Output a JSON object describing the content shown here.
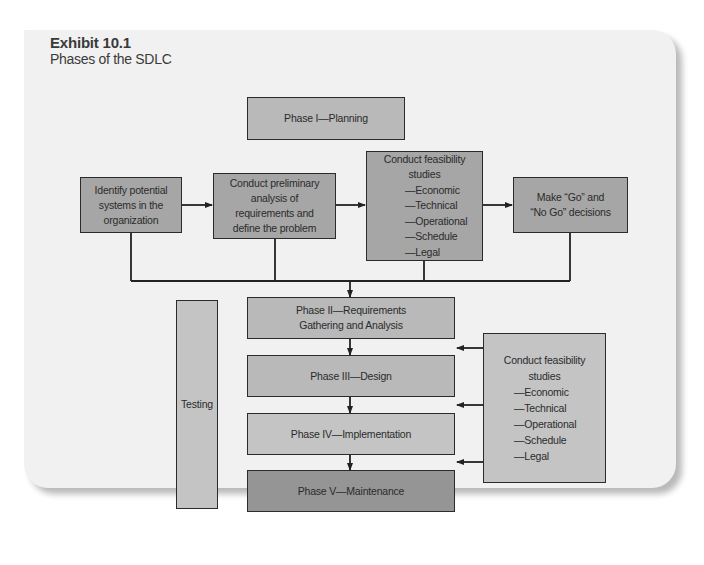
{
  "exhibit": {
    "title": "Exhibit 10.1",
    "subtitle": "Phases of the SDLC"
  },
  "diagram": {
    "phase1": "Phase I—Planning",
    "planning_steps": [
      {
        "id": "identify",
        "lines": [
          "Identify potential",
          "systems in the",
          "organization"
        ]
      },
      {
        "id": "preliminary",
        "lines": [
          "Conduct preliminary",
          "analysis of",
          "requirements and",
          "define the problem"
        ]
      },
      {
        "id": "feasibility",
        "lines": [
          "Conduct feasibility",
          "studies"
        ],
        "items": [
          "—Economic",
          "—Technical",
          "—Operational",
          "—Schedule",
          "—Legal"
        ]
      },
      {
        "id": "go-nogo",
        "lines": [
          "Make “Go” and",
          "“No Go” decisions"
        ]
      }
    ],
    "phases": [
      {
        "lines": [
          "Phase II—Requirements",
          "Gathering and Analysis"
        ]
      },
      {
        "lines": [
          "Phase III—Design"
        ]
      },
      {
        "lines": [
          "Phase IV—Implementation"
        ]
      },
      {
        "lines": [
          "Phase V—Maintenance"
        ]
      }
    ],
    "testing": "Testing",
    "side_feasibility": {
      "lines": [
        "Conduct feasibility",
        "studies"
      ],
      "items": [
        "—Economic",
        "—Technical",
        "—Operational",
        "—Schedule",
        "—Legal"
      ]
    }
  },
  "colors": {
    "card_bg": "#f1f1f1",
    "box_dark": "#959595",
    "box_mid": "#a6a6a6",
    "box_light": "#c4c4c4",
    "line": "#222222"
  }
}
